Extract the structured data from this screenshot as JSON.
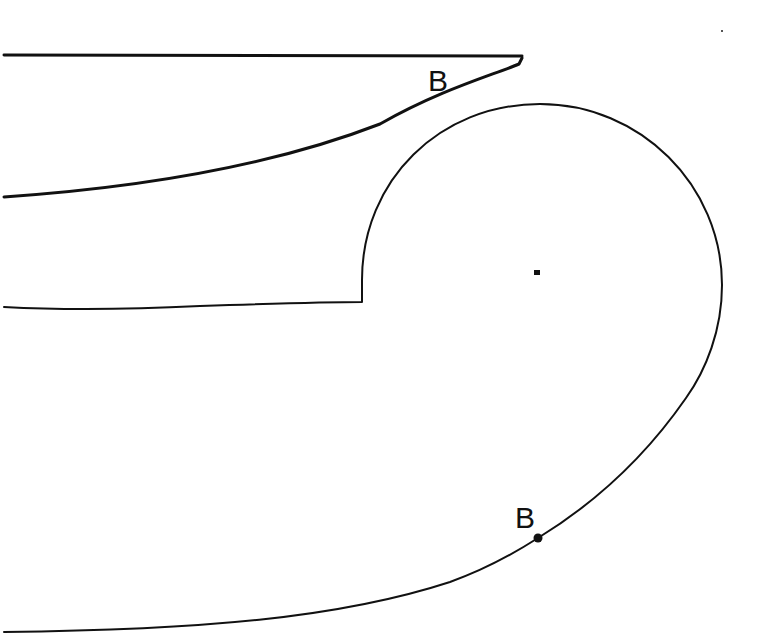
{
  "diagram": {
    "type": "line-drawing",
    "stroke_color": "#111111",
    "background_color": "#ffffff",
    "labels": [
      {
        "text": "B",
        "x": 437,
        "y": 79
      },
      {
        "text": "B",
        "x": 524,
        "y": 516
      }
    ],
    "points": [
      {
        "name": "point-b-lower",
        "x": 538,
        "y": 538
      },
      {
        "name": "center-mark",
        "x": 537,
        "y": 272
      },
      {
        "name": "stray-mark",
        "x": 722,
        "y": 31
      }
    ],
    "paths": {
      "top_edge": "M4,55 L522,56",
      "upper_curve": "M522,58 L519,64 C490,76 440,90 380,124 C300,155 180,185 4,197",
      "volute": "M4,307 C60,310 120,310 200,306 C260,304 320,302 362,302 L362,280 C362,180 440,104 540,104 C640,104 722,185 722,285 C722,330 706,370 686,398 C650,450 600,500 538,538 C510,556 478,572 450,582 C340,618 200,630 4,632"
    }
  }
}
